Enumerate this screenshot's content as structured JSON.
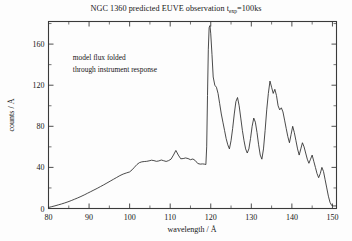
{
  "figure": {
    "title_main": "NGC 1360  predicted EUVE observation t",
    "title_sub": "exp",
    "title_tail": "=100ks",
    "background": "#fdfdfd",
    "curve_color": "#2b2b2b",
    "axis_color": "#3a3a3a"
  },
  "annotation": {
    "line1": "model flux folded",
    "line2": "through instrument response"
  },
  "chart_data": {
    "type": "line",
    "xlabel": "wavelength / Å",
    "ylabel": "counts / Å",
    "xlim": [
      80,
      151
    ],
    "ylim": [
      0,
      182
    ],
    "xticks": [
      80,
      90,
      100,
      110,
      120,
      130,
      140,
      150
    ],
    "xtick_labels": [
      "80",
      "90",
      "100",
      "110",
      "120",
      "130",
      "140",
      "150"
    ],
    "yticks": [
      0,
      40,
      80,
      120,
      160
    ],
    "ytick_labels": [
      "0",
      "40",
      "80",
      "120",
      "160"
    ],
    "x_minor_step": 5,
    "y_minor_step": 20,
    "grid": false,
    "legend": null,
    "annotations": [
      {
        "text": "model flux folded",
        "x": 86,
        "y": 145
      },
      {
        "text": "through instrument response",
        "x": 86,
        "y": 133
      }
    ],
    "series": [
      {
        "name": "predicted EUVE count rate",
        "color": "#2b2b2b",
        "x": [
          80.0,
          80.8,
          81.6,
          82.4,
          83.2,
          84.0,
          84.8,
          85.6,
          86.4,
          87.2,
          88.0,
          88.8,
          89.6,
          90.4,
          91.2,
          92.0,
          92.8,
          93.6,
          94.4,
          95.2,
          96.0,
          96.8,
          97.6,
          98.4,
          99.2,
          100.0,
          100.6,
          101.2,
          101.8,
          102.4,
          103.0,
          103.6,
          104.2,
          104.8,
          105.4,
          106.0,
          106.6,
          107.2,
          107.8,
          108.4,
          109.0,
          109.6,
          110.2,
          110.8,
          111.4,
          112.0,
          112.6,
          113.2,
          113.8,
          114.4,
          115.0,
          115.6,
          116.2,
          116.8,
          117.4,
          118.0,
          118.4,
          118.8,
          119.0,
          119.2,
          119.4,
          119.6,
          119.8,
          120.0,
          120.3,
          120.6,
          121.0,
          121.4,
          121.8,
          122.2,
          122.6,
          123.0,
          123.4,
          123.8,
          124.2,
          124.6,
          125.0,
          125.4,
          125.8,
          126.2,
          126.6,
          127.0,
          127.4,
          127.8,
          128.2,
          128.6,
          129.0,
          129.4,
          129.8,
          130.2,
          130.6,
          131.0,
          131.4,
          131.8,
          132.2,
          132.6,
          133.0,
          133.4,
          133.8,
          134.2,
          134.6,
          135.0,
          135.4,
          135.8,
          136.2,
          136.6,
          137.0,
          137.4,
          137.8,
          138.2,
          138.6,
          139.0,
          139.4,
          139.8,
          140.2,
          140.6,
          141.0,
          141.4,
          141.8,
          142.2,
          142.6,
          143.0,
          143.4,
          143.8,
          144.2,
          144.6,
          145.0,
          145.4,
          145.8,
          146.2,
          146.6,
          147.0,
          147.4,
          147.8,
          148.2,
          148.6,
          149.0,
          149.4,
          149.8,
          150.2,
          150.6,
          151.0
        ],
        "y": [
          1.0,
          1.8,
          2.6,
          3.5,
          4.4,
          5.4,
          6.5,
          7.7,
          9.0,
          10.3,
          11.7,
          13.2,
          14.8,
          16.4,
          18.0,
          19.6,
          21.3,
          23.0,
          24.8,
          26.6,
          28.4,
          30.2,
          32.0,
          33.5,
          34.6,
          35.6,
          37.6,
          40.2,
          42.8,
          44.6,
          45.4,
          45.7,
          45.9,
          46.4,
          47.0,
          46.6,
          45.9,
          46.3,
          47.2,
          46.5,
          45.8,
          46.6,
          48.0,
          52.0,
          56.5,
          52.0,
          48.4,
          48.6,
          49.2,
          48.6,
          47.5,
          48.2,
          46.6,
          43.8,
          43.2,
          43.4,
          43.2,
          42.8,
          60.0,
          110.0,
          155.0,
          176.0,
          178.0,
          170.0,
          150.0,
          128.0,
          120.0,
          118.0,
          112.0,
          102.0,
          92.0,
          84.0,
          76.0,
          68.0,
          62.0,
          58.0,
          66.0,
          78.0,
          92.0,
          104.0,
          108.0,
          100.0,
          88.0,
          76.0,
          66.0,
          58.0,
          54.0,
          58.0,
          68.0,
          80.0,
          88.0,
          84.0,
          74.0,
          62.0,
          52.0,
          48.0,
          58.0,
          76.0,
          96.0,
          112.0,
          124.0,
          118.0,
          112.0,
          116.0,
          110.0,
          100.0,
          96.0,
          98.0,
          94.0,
          86.0,
          78.0,
          70.0,
          64.0,
          72.0,
          80.0,
          74.0,
          66.0,
          58.0,
          52.0,
          58.0,
          64.0,
          60.0,
          54.0,
          48.0,
          44.0,
          48.0,
          52.0,
          46.0,
          40.0,
          34.0,
          30.0,
          34.0,
          40.0,
          36.0,
          28.0,
          20.0,
          12.0,
          6.0,
          3.0,
          2.5,
          2.5,
          2.5
        ]
      }
    ]
  },
  "axes": {
    "x_title": "wavelength / Å",
    "y_title": "counts / Å"
  }
}
